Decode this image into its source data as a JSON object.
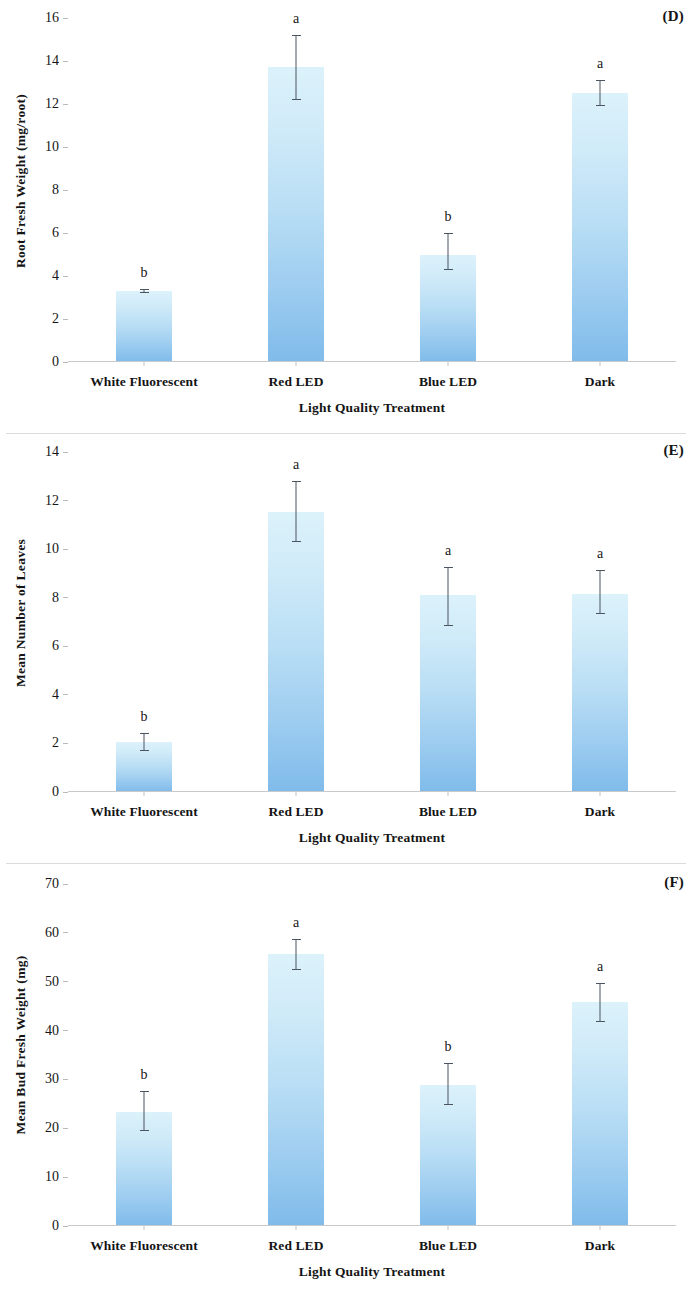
{
  "figure": {
    "panels": [
      {
        "letter": "(D)",
        "chart_data": {
          "type": "bar",
          "title": "",
          "xlabel": "Light Quality Treatment",
          "ylabel": "Root Fresh Weight (mg/root)",
          "categories": [
            "White Fluorescent",
            "Red LED",
            "Blue LED",
            "Dark"
          ],
          "values": [
            3.3,
            13.7,
            5.0,
            12.5
          ],
          "errors_low": [
            3.2,
            12.2,
            4.3,
            11.9
          ],
          "errors_high": [
            3.4,
            15.2,
            6.0,
            13.1
          ],
          "annotations": [
            "b",
            "a",
            "b",
            "a"
          ],
          "ylim": [
            0,
            16
          ],
          "yticks": [
            0,
            2,
            4,
            6,
            8,
            10,
            12,
            14,
            16
          ],
          "ytick_labels": [
            "0",
            "2",
            "4",
            "6",
            "8",
            "10",
            "12",
            "14",
            "16"
          ],
          "grid": false,
          "legend": "none"
        }
      },
      {
        "letter": "(E)",
        "chart_data": {
          "type": "bar",
          "title": "",
          "xlabel": "Light Quality Treatment",
          "ylabel": "Mean Number of Leaves",
          "categories": [
            "White Fluorescent",
            "Red LED",
            "Blue LED",
            "Dark"
          ],
          "values": [
            2.05,
            11.55,
            8.1,
            8.15
          ],
          "errors_low": [
            1.7,
            10.3,
            6.85,
            7.35
          ],
          "errors_high": [
            2.45,
            12.8,
            9.25,
            9.15
          ],
          "annotations": [
            "b",
            "a",
            "a",
            "a"
          ],
          "ylim": [
            0,
            14
          ],
          "yticks": [
            0,
            2,
            4,
            6,
            8,
            10,
            12,
            14
          ],
          "ytick_labels": [
            "0",
            "2",
            "4",
            "6",
            "8",
            "10",
            "12",
            "14"
          ],
          "grid": false,
          "legend": "none"
        }
      },
      {
        "letter": "(F)",
        "chart_data": {
          "type": "bar",
          "title": "",
          "xlabel": "Light Quality Treatment",
          "ylabel": "Mean Bud Fresh Weight (mg)",
          "categories": [
            "White Fluorescent",
            "Red LED",
            "Blue LED",
            "Dark"
          ],
          "values": [
            23.4,
            55.6,
            28.9,
            45.9
          ],
          "errors_low": [
            19.4,
            52.4,
            24.7,
            41.8
          ],
          "errors_high": [
            27.7,
            58.8,
            33.3,
            49.7
          ],
          "annotations": [
            "b",
            "a",
            "b",
            "a"
          ],
          "ylim": [
            0,
            70
          ],
          "yticks": [
            0,
            10,
            20,
            30,
            40,
            50,
            60,
            70
          ],
          "ytick_labels": [
            "0",
            "10",
            "20",
            "30",
            "40",
            "50",
            "60",
            "70"
          ],
          "grid": false,
          "legend": "none"
        }
      }
    ],
    "colors": {
      "bar_gradient_top": "#dcf2fb",
      "bar_gradient_bottom": "#7fbbea",
      "error_bar": "#4a5560",
      "axis": "#c9c9c9",
      "text": "#141414"
    }
  }
}
